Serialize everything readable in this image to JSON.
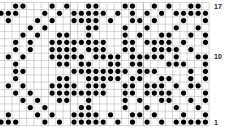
{
  "chart_data": {
    "type": "heatmap",
    "title": "",
    "columns": 29,
    "rows": 17,
    "row_labels": [
      {
        "row": 17,
        "text": "17"
      },
      {
        "row": 10,
        "text": "10"
      },
      {
        "row": 1,
        "text": "1"
      }
    ],
    "grid_color": "#aaaaaa",
    "dot_color": "#000000",
    "dots": [
      [
        2,
        3,
        7,
        9,
        12,
        13,
        17,
        18,
        21,
        23,
        26,
        27
      ],
      [
        0,
        1,
        2,
        6,
        8,
        10,
        11,
        12,
        13,
        14,
        16,
        18,
        20,
        22,
        24,
        25,
        26,
        27,
        28
      ],
      [
        1,
        5,
        7,
        10,
        11,
        12,
        13,
        15,
        18,
        19,
        21,
        25,
        28
      ],
      [
        4,
        6,
        12,
        13,
        17,
        20,
        24,
        27
      ],
      [
        3,
        5,
        8,
        9,
        12,
        17,
        19,
        22,
        23,
        26,
        28
      ],
      [
        2,
        4,
        7,
        8,
        9,
        10,
        11,
        12,
        13,
        14,
        17,
        18,
        20,
        21,
        22,
        23,
        25,
        28
      ],
      [
        2,
        4,
        7,
        8,
        9,
        10,
        12,
        13,
        14,
        17,
        18,
        21,
        22,
        23,
        24,
        26
      ],
      [
        1,
        3,
        7,
        8,
        9,
        10,
        11,
        13,
        14,
        15,
        16,
        18,
        19,
        20,
        21,
        22,
        24,
        27,
        28
      ],
      [
        2,
        8,
        9,
        11,
        12,
        15,
        16,
        18,
        19,
        23,
        24,
        25,
        28
      ],
      [
        2,
        3,
        10,
        11,
        12,
        13,
        14,
        15,
        16,
        17,
        19,
        20,
        21,
        26,
        28
      ],
      [
        2,
        8,
        9,
        12,
        13,
        14,
        15,
        16,
        18,
        19,
        22,
        23,
        26,
        28
      ],
      [
        1,
        3,
        7,
        8,
        9,
        10,
        12,
        13,
        14,
        17,
        18,
        20,
        21,
        22,
        24,
        26,
        27
      ],
      [
        2,
        4,
        7,
        8,
        9,
        10,
        11,
        12,
        13,
        14,
        17,
        18,
        20,
        21,
        22,
        23,
        25,
        28
      ],
      [
        3,
        5,
        8,
        9,
        12,
        17,
        19,
        22,
        23,
        26,
        28
      ],
      [
        4,
        6,
        11,
        12,
        17,
        20,
        24,
        27
      ],
      [
        1,
        5,
        7,
        10,
        11,
        12,
        13,
        15,
        18,
        19,
        21,
        25,
        28
      ],
      [
        0,
        1,
        2,
        6,
        8,
        10,
        11,
        12,
        13,
        14,
        16,
        18,
        20,
        22,
        24,
        25,
        26,
        27,
        28
      ]
    ]
  }
}
